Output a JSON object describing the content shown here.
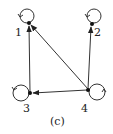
{
  "caption": "(c)",
  "colors": {
    "stroke": "#333333",
    "node": "#111111",
    "text": "#222222",
    "background": "#ffffff"
  },
  "nodes": [
    {
      "id": "1",
      "label": "1"
    },
    {
      "id": "2",
      "label": "2"
    },
    {
      "id": "3",
      "label": "3"
    },
    {
      "id": "4",
      "label": "4"
    }
  ],
  "edges": [
    {
      "from": "3",
      "to": "1"
    },
    {
      "from": "4",
      "to": "1"
    },
    {
      "from": "4",
      "to": "2"
    },
    {
      "from": "4",
      "to": "3"
    }
  ],
  "self_loops": [
    "1",
    "2",
    "3",
    "4"
  ]
}
